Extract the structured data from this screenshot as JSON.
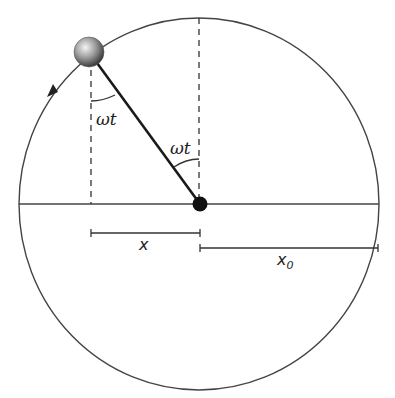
{
  "diagram": {
    "labels": {
      "angle_left": "ωt",
      "angle_center": "ωt",
      "x": "x",
      "x0_base": "x",
      "x0_sub": "0"
    },
    "colors": {
      "stroke": "#333333",
      "rod": "#1a1a1a",
      "pivot": "#111111",
      "ball_light": "#f2f2f2",
      "ball_dark": "#3a3a3a"
    },
    "direction": "counterclockwise"
  }
}
